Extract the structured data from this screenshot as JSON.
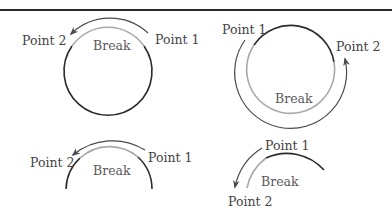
{
  "colors": {
    "segment_dark": "#2b2b2b",
    "segment_break": "#a9a9a9",
    "arrow": "#4a4a4a",
    "text": "#444444"
  },
  "panels": [
    {
      "id": "full-circle-short-break",
      "point1": "Point 1",
      "point2": "Point 2",
      "break": "Break",
      "description": "Full circle; break along top short arc; arrow travels counter-clockwise over the top from Point 1 to Point 2"
    },
    {
      "id": "full-circle-long-break",
      "point1": "Point 1",
      "point2": "Point 2",
      "break": "Break",
      "description": "Full circle; break along long lower arc; arrow travels counter-clockwise around the bottom from Point 1 to Point 2"
    },
    {
      "id": "partial-arc-short-break",
      "point1": "Point 1",
      "point2": "Point 2",
      "break": "Break",
      "description": "Open arc; break along top; arrow travels over the top from Point 1 to Point 2"
    },
    {
      "id": "partial-arc-end-break",
      "point1": "Point 1",
      "point2": "Point 2",
      "break": "Break",
      "description": "Open arc; break near the left end; arrow travels down-left from Point 1 to Point 2"
    }
  ]
}
